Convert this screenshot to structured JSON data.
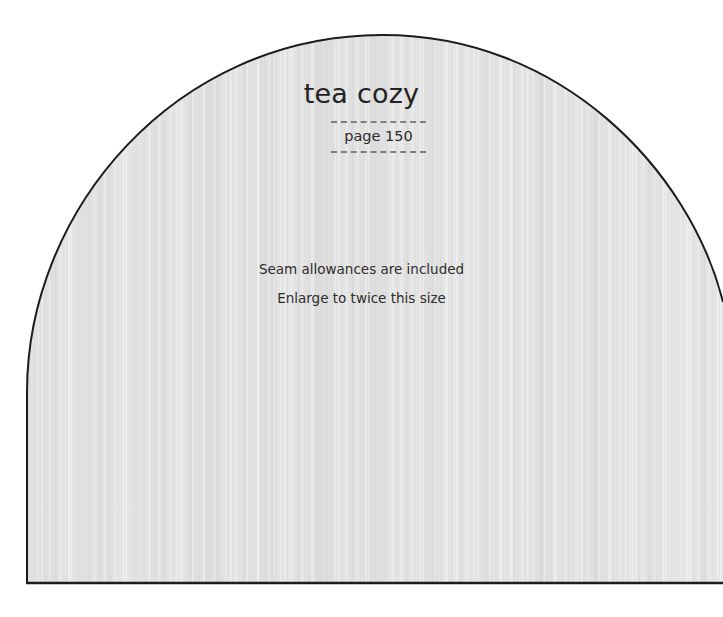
{
  "document": {
    "kind": "sewing-pattern-sheet",
    "background_color": "#ffffff"
  },
  "pattern_piece": {
    "name": "tea-cozy-dome",
    "outline_color": "#1c1c1c",
    "fill_color": "#e2e2e2",
    "texture": "vertical paper scan striping",
    "shape": "dome / arched rectangle, right edge clipped by page boundary"
  },
  "title": {
    "text": "tea cozy"
  },
  "page_reference": {
    "label": "page 150",
    "rule_style": "dashed",
    "rule_color": "#6f6f6f"
  },
  "notes": {
    "line_1": "Seam allowances are included",
    "line_2": "Enlarge to twice this size"
  }
}
